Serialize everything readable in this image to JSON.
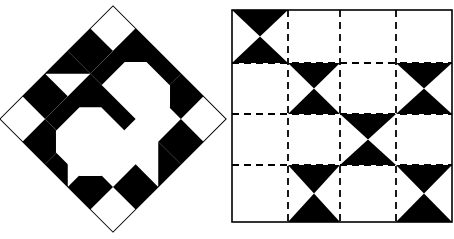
{
  "figure": {
    "title": "",
    "background_color": "#ffffff",
    "ink_color": "#000000",
    "width": 454,
    "height": 239,
    "panel_count": 2
  },
  "left_panel": {
    "name": "quilt-block-diamond",
    "description": "Square patchwork block rotated 45 degrees forming a diamond",
    "rotation_degrees": 45,
    "center_x": 113,
    "center_y": 119,
    "block_size": 160,
    "grid": 5,
    "cell_size": 32,
    "outline_color": "#000000",
    "outline_width": 1,
    "fill_color": "#000000",
    "cells": [
      {
        "row": 0,
        "col": 0,
        "type": "blank"
      },
      {
        "row": 0,
        "col": 1,
        "type": "solid"
      },
      {
        "row": 0,
        "col": 2,
        "type": "corner-triangle",
        "corner": "tl"
      },
      {
        "row": 0,
        "col": 3,
        "type": "solid"
      },
      {
        "row": 0,
        "col": 4,
        "type": "blank"
      },
      {
        "row": 1,
        "col": 0,
        "type": "solid"
      },
      {
        "row": 1,
        "col": 1,
        "type": "blank"
      },
      {
        "row": 1,
        "col": 2,
        "type": "blank"
      },
      {
        "row": 1,
        "col": 3,
        "type": "blank"
      },
      {
        "row": 1,
        "col": 4,
        "type": "solid"
      },
      {
        "row": 2,
        "col": 0,
        "type": "corner-triangle",
        "corner": "tl"
      },
      {
        "row": 2,
        "col": 1,
        "type": "blank"
      },
      {
        "row": 2,
        "col": 2,
        "type": "blank"
      },
      {
        "row": 2,
        "col": 3,
        "type": "blank"
      },
      {
        "row": 2,
        "col": 4,
        "type": "corner-triangle",
        "corner": "tr"
      },
      {
        "row": 3,
        "col": 0,
        "type": "solid"
      },
      {
        "row": 3,
        "col": 1,
        "type": "blank"
      },
      {
        "row": 3,
        "col": 2,
        "type": "blank"
      },
      {
        "row": 3,
        "col": 3,
        "type": "blank"
      },
      {
        "row": 3,
        "col": 4,
        "type": "solid"
      },
      {
        "row": 4,
        "col": 0,
        "type": "blank"
      },
      {
        "row": 4,
        "col": 1,
        "type": "solid"
      },
      {
        "row": 4,
        "col": 2,
        "type": "corner-triangle",
        "corner": "bl"
      },
      {
        "row": 4,
        "col": 3,
        "type": "solid"
      },
      {
        "row": 4,
        "col": 4,
        "type": "blank"
      }
    ],
    "motifs": [
      {
        "name": "snowball-octagon-top",
        "center_col": 2.0,
        "center_row": 1.0
      },
      {
        "name": "snowball-octagon-bottom",
        "center_col": 2.0,
        "center_row": 3.0
      }
    ]
  },
  "right_panel": {
    "name": "quilt-layout-grid",
    "description": "Four by four setting grid with dashed seam lines and hourglass X blocks",
    "left": 232,
    "top": 10,
    "right": 452,
    "bottom": 222,
    "columns": 4,
    "rows": 4,
    "column_x": [
      232,
      288,
      340,
      396,
      452
    ],
    "row_y": [
      10,
      63,
      114,
      165,
      222
    ],
    "border": {
      "style": "solid",
      "color": "#000000",
      "width": 1.6
    },
    "interior_lines": {
      "style": "dashed",
      "color": "#000000",
      "width": 1.8,
      "dash": "7,5"
    },
    "block_fill": "#000000",
    "blocks": [
      {
        "row": 0,
        "col": 0,
        "type": "hourglass-x"
      },
      {
        "row": 0,
        "col": 1,
        "type": "plain"
      },
      {
        "row": 0,
        "col": 2,
        "type": "plain"
      },
      {
        "row": 0,
        "col": 3,
        "type": "plain"
      },
      {
        "row": 1,
        "col": 0,
        "type": "plain"
      },
      {
        "row": 1,
        "col": 1,
        "type": "hourglass-x"
      },
      {
        "row": 1,
        "col": 2,
        "type": "plain"
      },
      {
        "row": 1,
        "col": 3,
        "type": "hourglass-x"
      },
      {
        "row": 2,
        "col": 0,
        "type": "plain"
      },
      {
        "row": 2,
        "col": 1,
        "type": "plain"
      },
      {
        "row": 2,
        "col": 2,
        "type": "hourglass-x"
      },
      {
        "row": 2,
        "col": 3,
        "type": "plain"
      },
      {
        "row": 3,
        "col": 0,
        "type": "plain"
      },
      {
        "row": 3,
        "col": 1,
        "type": "hourglass-x"
      },
      {
        "row": 3,
        "col": 2,
        "type": "plain"
      },
      {
        "row": 3,
        "col": 3,
        "type": "hourglass-x"
      }
    ]
  }
}
